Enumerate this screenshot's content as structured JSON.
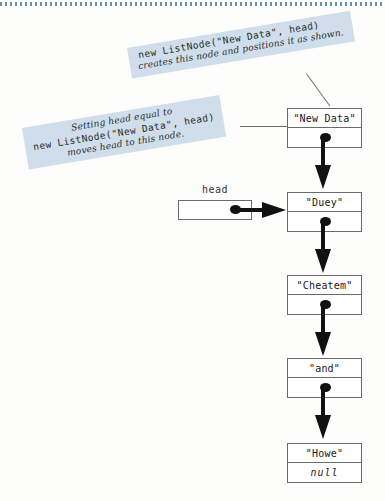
{
  "figure": {
    "accent_color": "#cfdeea",
    "rule_color": "#4b7c9e",
    "ink_color": "#111111"
  },
  "callouts": [
    {
      "id": "callout-new",
      "code_line": "new ListNode(\"New Data\", head)",
      "text_line": "creates this node and positions it as shown."
    },
    {
      "id": "callout-head",
      "text_line_1": "Setting head equal to",
      "code_line": "new ListNode(\"New Data\", head)",
      "text_line_2": "moves head to this node."
    }
  ],
  "head_pointer": {
    "label": "head",
    "value": ""
  },
  "nodes": [
    {
      "data": "\"New Data\"",
      "next": "",
      "next_is_null": false
    },
    {
      "data": "\"Duey\"",
      "next": "",
      "next_is_null": false
    },
    {
      "data": "\"Cheatem\"",
      "next": "",
      "next_is_null": false
    },
    {
      "data": "\"and\"",
      "next": "",
      "next_is_null": false
    },
    {
      "data": "\"Howe\"",
      "next": "null",
      "next_is_null": true
    }
  ]
}
